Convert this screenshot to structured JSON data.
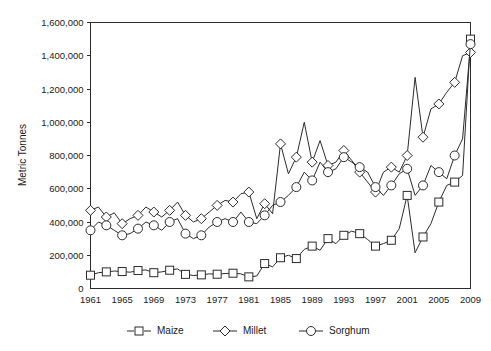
{
  "chart_data": {
    "type": "line",
    "title": "",
    "xlabel": "",
    "ylabel": "Metric Tonnes",
    "ylim": [
      0,
      1600000
    ],
    "ytick_step": 200000,
    "yticks": [
      0,
      200000,
      400000,
      600000,
      800000,
      1000000,
      1200000,
      1400000,
      1600000
    ],
    "ytick_labels": [
      "0",
      "200,000",
      "400,000",
      "600,000",
      "800,000",
      "1,000,000",
      "1,200,000",
      "1,400,000",
      "1,600,000"
    ],
    "xlim": [
      1961,
      2009
    ],
    "xtick_step": 4,
    "xticks": [
      1961,
      1965,
      1969,
      1973,
      1977,
      1981,
      1985,
      1989,
      1993,
      1997,
      2001,
      2005,
      2009
    ],
    "xtick_labels": [
      "1961",
      "1965",
      "1969",
      "1973",
      "1977",
      "1981",
      "1985",
      "1989",
      "1993",
      "1997",
      "2001",
      "2005",
      "2009"
    ],
    "grid": false,
    "legend_position": "bottom",
    "marker_every": 2,
    "x": [
      1961,
      1962,
      1963,
      1964,
      1965,
      1966,
      1967,
      1968,
      1969,
      1970,
      1971,
      1972,
      1973,
      1974,
      1975,
      1976,
      1977,
      1978,
      1979,
      1980,
      1981,
      1982,
      1983,
      1984,
      1985,
      1986,
      1987,
      1988,
      1989,
      1990,
      1991,
      1992,
      1993,
      1994,
      1995,
      1996,
      1997,
      1998,
      1999,
      2000,
      2001,
      2002,
      2003,
      2004,
      2005,
      2006,
      2007,
      2008,
      2009
    ],
    "series": [
      {
        "name": "Maize",
        "marker": "square",
        "color": "#2b2b2b",
        "values": [
          80000,
          95000,
          100000,
          105000,
          102000,
          98000,
          108000,
          112000,
          95000,
          100000,
          110000,
          118000,
          85000,
          78000,
          82000,
          88000,
          86000,
          90000,
          92000,
          88000,
          70000,
          75000,
          150000,
          130000,
          185000,
          200000,
          180000,
          235000,
          255000,
          230000,
          300000,
          270000,
          320000,
          345000,
          330000,
          295000,
          255000,
          270000,
          290000,
          360000,
          560000,
          215000,
          310000,
          390000,
          520000,
          620000,
          640000,
          680000,
          1500000
        ]
      },
      {
        "name": "Millet",
        "marker": "diamond",
        "color": "#2b2b2b",
        "values": [
          470000,
          490000,
          430000,
          455000,
          390000,
          420000,
          440000,
          490000,
          460000,
          430000,
          470000,
          520000,
          440000,
          400000,
          420000,
          460000,
          500000,
          530000,
          520000,
          570000,
          580000,
          420000,
          510000,
          450000,
          870000,
          690000,
          790000,
          1000000,
          760000,
          890000,
          740000,
          760000,
          830000,
          770000,
          700000,
          640000,
          580000,
          700000,
          730000,
          700000,
          800000,
          1270000,
          910000,
          1080000,
          1110000,
          1180000,
          1240000,
          1400000,
          1420000
        ]
      },
      {
        "name": "Sorghum",
        "marker": "circle",
        "color": "#2b2b2b",
        "values": [
          350000,
          400000,
          380000,
          350000,
          320000,
          330000,
          360000,
          400000,
          380000,
          350000,
          400000,
          420000,
          330000,
          300000,
          320000,
          370000,
          400000,
          420000,
          400000,
          460000,
          400000,
          390000,
          440000,
          500000,
          520000,
          560000,
          610000,
          700000,
          650000,
          760000,
          700000,
          720000,
          790000,
          760000,
          730000,
          700000,
          610000,
          560000,
          620000,
          690000,
          720000,
          560000,
          620000,
          740000,
          700000,
          660000,
          800000,
          900000,
          1470000
        ]
      }
    ]
  },
  "legend": {
    "items": [
      {
        "label": "Maize",
        "marker": "square"
      },
      {
        "label": "Millet",
        "marker": "diamond"
      },
      {
        "label": "Sorghum",
        "marker": "circle"
      }
    ]
  }
}
